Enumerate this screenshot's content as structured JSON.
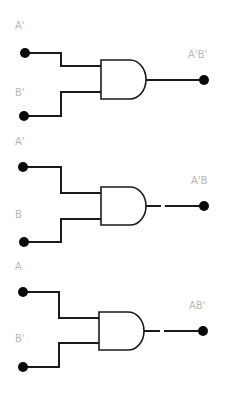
{
  "diagram": {
    "type": "logic-circuit",
    "colors": {
      "wire": "#1a1a1a",
      "terminal": "#0a0a0a",
      "label": "#b8b8b8",
      "background": "#ffffff"
    },
    "gates": [
      {
        "type": "AND",
        "input_a_label": "A'",
        "input_b_label": "B'",
        "output_label": "A'B'"
      },
      {
        "type": "AND",
        "input_a_label": "A'",
        "input_b_label": "B",
        "output_label": "A'B"
      },
      {
        "type": "AND",
        "input_a_label": "A",
        "input_b_label": "B'",
        "output_label": "AB'"
      }
    ]
  }
}
